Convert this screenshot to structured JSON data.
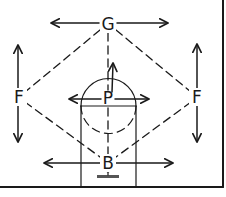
{
  "diagram": {
    "type": "basketball-court-positions",
    "colors": {
      "ink": "#1a1a1a",
      "background": "#ffffff",
      "backboard": "#555555"
    },
    "positions": [
      {
        "id": "guard",
        "label": "G",
        "x": 108,
        "y": 24,
        "movement": "horizontal"
      },
      {
        "id": "forward-left",
        "label": "F",
        "x": 19,
        "y": 97,
        "movement": "vertical"
      },
      {
        "id": "forward-right",
        "label": "F",
        "x": 197,
        "y": 97,
        "movement": "vertical"
      },
      {
        "id": "post",
        "label": "P",
        "x": 108,
        "y": 99,
        "movement": "horizontal-and-up"
      },
      {
        "id": "back",
        "label": "B",
        "x": 108,
        "y": 163,
        "movement": "horizontal"
      }
    ],
    "connections": [
      [
        "guard",
        "forward-left"
      ],
      [
        "guard",
        "forward-right"
      ],
      [
        "forward-left",
        "back"
      ],
      [
        "forward-right",
        "back"
      ],
      [
        "guard",
        "post"
      ],
      [
        "post",
        "back"
      ]
    ],
    "court_elements": [
      "court-border",
      "free-throw-lane",
      "free-throw-circle",
      "free-throw-line",
      "backboard-and-basket"
    ]
  }
}
